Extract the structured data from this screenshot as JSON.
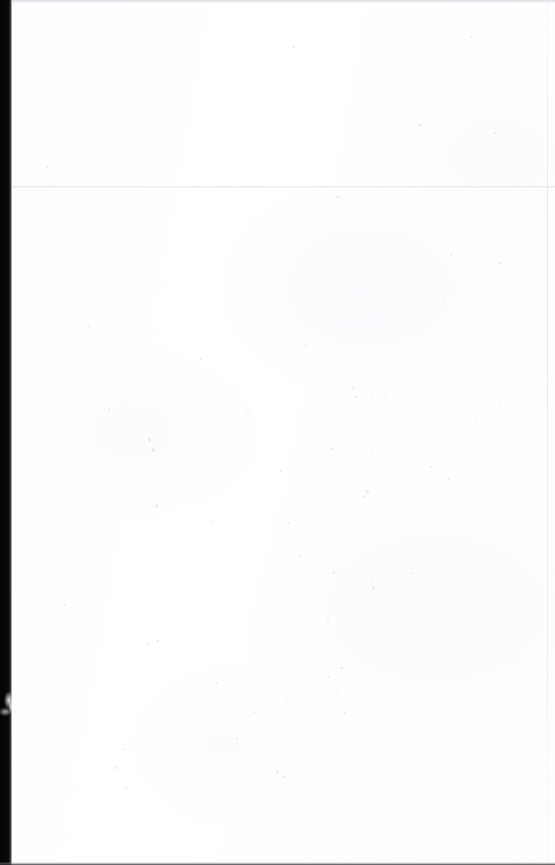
{
  "document": {
    "kind": "scanned-page",
    "content_state": "blank",
    "visible_text": "",
    "description": "Scanned blank page. No text, headings, figures or interface elements are rendered anywhere on the page.",
    "page_width_px": 555,
    "page_height_px": 865
  },
  "colors": {
    "paper": "#ffffff",
    "paper_tint": "#fdfdfe",
    "binding_gutter": "#050505",
    "gutter_edge_falloff": "#3b3b3b",
    "top_edge_band": "#c4c4ca",
    "scan_seam": "#cecece",
    "right_edge_line": "#d6d6dc",
    "bottom_edge_line": "#28282c",
    "dust_speck": "#9e9ea8"
  },
  "artifacts": {
    "binding_gutter": {
      "name": "binding-gutter",
      "edge": "left",
      "x_start_px": 0,
      "x_end_px": 12,
      "y_start_px": 0,
      "y_end_px": 865
    },
    "gutter_smudge": {
      "name": "gutter-smudge",
      "x_px": 0,
      "y_px": 688,
      "width_px": 13,
      "height_px": 36
    },
    "top_edge_band": {
      "name": "top-edge-band",
      "y_px": 0,
      "height_px": 4
    },
    "scan_seam": {
      "name": "horizontal-scan-seam",
      "y_px": 186,
      "height_px": 2
    },
    "right_edge_line": {
      "name": "right-edge-line",
      "x_px": 547,
      "width_px": 1
    },
    "bottom_edge_line": {
      "name": "bottom-edge-line",
      "y_px": 862,
      "height_px": 3
    },
    "dust_specks": [
      {
        "x": 292,
        "y": 46,
        "w": 3,
        "h": 2
      },
      {
        "x": 470,
        "y": 36,
        "w": 2,
        "h": 2
      },
      {
        "x": 374,
        "y": 48,
        "w": 2,
        "h": 1
      },
      {
        "x": 418,
        "y": 124,
        "w": 4,
        "h": 2
      },
      {
        "x": 336,
        "y": 196,
        "w": 3,
        "h": 2
      },
      {
        "x": 200,
        "y": 358,
        "w": 2,
        "h": 2
      },
      {
        "x": 352,
        "y": 386,
        "w": 3,
        "h": 3
      },
      {
        "x": 262,
        "y": 300,
        "w": 2,
        "h": 1
      },
      {
        "x": 305,
        "y": 345,
        "w": 2,
        "h": 2
      },
      {
        "x": 148,
        "y": 437,
        "w": 3,
        "h": 5
      },
      {
        "x": 152,
        "y": 448,
        "w": 3,
        "h": 4
      },
      {
        "x": 330,
        "y": 448,
        "w": 4,
        "h": 2
      },
      {
        "x": 355,
        "y": 396,
        "w": 3,
        "h": 2
      },
      {
        "x": 372,
        "y": 396,
        "w": 2,
        "h": 2
      },
      {
        "x": 247,
        "y": 410,
        "w": 2,
        "h": 2
      },
      {
        "x": 384,
        "y": 398,
        "w": 2,
        "h": 1
      },
      {
        "x": 430,
        "y": 466,
        "w": 3,
        "h": 2
      },
      {
        "x": 370,
        "y": 452,
        "w": 2,
        "h": 2
      },
      {
        "x": 365,
        "y": 490,
        "w": 4,
        "h": 3
      },
      {
        "x": 210,
        "y": 520,
        "w": 2,
        "h": 2
      },
      {
        "x": 363,
        "y": 496,
        "w": 3,
        "h": 2
      },
      {
        "x": 155,
        "y": 504,
        "w": 3,
        "h": 4
      },
      {
        "x": 288,
        "y": 522,
        "w": 2,
        "h": 2
      },
      {
        "x": 280,
        "y": 470,
        "w": 2,
        "h": 2
      },
      {
        "x": 300,
        "y": 555,
        "w": 2,
        "h": 2
      },
      {
        "x": 332,
        "y": 572,
        "w": 3,
        "h": 2
      },
      {
        "x": 372,
        "y": 580,
        "w": 2,
        "h": 2
      },
      {
        "x": 372,
        "y": 586,
        "w": 3,
        "h": 3
      },
      {
        "x": 412,
        "y": 572,
        "w": 2,
        "h": 2
      },
      {
        "x": 156,
        "y": 640,
        "w": 3,
        "h": 2
      },
      {
        "x": 146,
        "y": 642,
        "w": 2,
        "h": 3
      },
      {
        "x": 327,
        "y": 620,
        "w": 2,
        "h": 3
      },
      {
        "x": 340,
        "y": 667,
        "w": 3,
        "h": 2
      },
      {
        "x": 328,
        "y": 676,
        "w": 2,
        "h": 2
      },
      {
        "x": 337,
        "y": 690,
        "w": 2,
        "h": 2
      },
      {
        "x": 343,
        "y": 712,
        "w": 3,
        "h": 2
      },
      {
        "x": 285,
        "y": 698,
        "w": 2,
        "h": 2
      },
      {
        "x": 253,
        "y": 712,
        "w": 2,
        "h": 2
      },
      {
        "x": 216,
        "y": 682,
        "w": 2,
        "h": 2
      },
      {
        "x": 122,
        "y": 748,
        "w": 2,
        "h": 2
      },
      {
        "x": 114,
        "y": 766,
        "w": 2,
        "h": 3
      },
      {
        "x": 276,
        "y": 770,
        "w": 3,
        "h": 3
      },
      {
        "x": 283,
        "y": 776,
        "w": 3,
        "h": 2
      },
      {
        "x": 125,
        "y": 786,
        "w": 2,
        "h": 3
      },
      {
        "x": 236,
        "y": 738,
        "w": 2,
        "h": 2
      },
      {
        "x": 442,
        "y": 300,
        "w": 2,
        "h": 2
      },
      {
        "x": 450,
        "y": 254,
        "w": 2,
        "h": 2
      },
      {
        "x": 498,
        "y": 262,
        "w": 3,
        "h": 2
      },
      {
        "x": 494,
        "y": 132,
        "w": 3,
        "h": 2
      },
      {
        "x": 500,
        "y": 402,
        "w": 2,
        "h": 2
      },
      {
        "x": 474,
        "y": 418,
        "w": 2,
        "h": 2
      },
      {
        "x": 447,
        "y": 478,
        "w": 3,
        "h": 2
      },
      {
        "x": 108,
        "y": 408,
        "w": 2,
        "h": 2
      },
      {
        "x": 88,
        "y": 325,
        "w": 2,
        "h": 2
      },
      {
        "x": 64,
        "y": 604,
        "w": 2,
        "h": 2
      },
      {
        "x": 46,
        "y": 166,
        "w": 2,
        "h": 2
      }
    ]
  }
}
